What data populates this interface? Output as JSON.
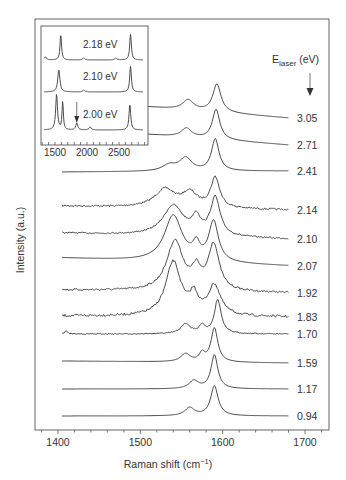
{
  "chart_data": {
    "type": "line",
    "title": "",
    "xlabel": "Raman shift (cm⁻¹)",
    "xlabel_parts": {
      "main": "Raman shift (cm",
      "sup": "−1",
      "end": ")"
    },
    "ylabel": "Intensity (a.u.)",
    "xlim": [
      1370,
      1730
    ],
    "xticks": [
      1400,
      1500,
      1600,
      1700
    ],
    "xtick_labels": [
      "1400",
      "1500",
      "1600",
      "1700"
    ],
    "legend_title": {
      "main": "E",
      "sub": "laser",
      "end": " (eV)"
    },
    "legend_arrow": "down-arrow",
    "grid": false,
    "series": [
      {
        "name": "3.05",
        "baseline_right": 118,
        "baseline_left": 100,
        "peaks": [
          [
            1593,
            28,
            12
          ],
          [
            1558,
            10,
            16
          ]
        ],
        "noise": 0
      },
      {
        "name": "2.71",
        "baseline_right": 145,
        "baseline_left": 128,
        "peaks": [
          [
            1592,
            30,
            11
          ],
          [
            1556,
            9,
            15
          ]
        ],
        "noise": 0
      },
      {
        "name": "2.41",
        "baseline_right": 171,
        "baseline_left": 172,
        "peaks": [
          [
            1591,
            32,
            11
          ],
          [
            1555,
            13,
            18
          ],
          [
            1535,
            6,
            20
          ]
        ],
        "noise": 0
      },
      {
        "name": "2.14",
        "baseline_right": 210,
        "baseline_left": 206,
        "peaks": [
          [
            1591,
            30,
            13
          ],
          [
            1560,
            14,
            22
          ],
          [
            1530,
            18,
            30
          ]
        ],
        "noise": 0.9
      },
      {
        "name": "2.10",
        "baseline_right": 239,
        "baseline_left": 233,
        "peaks": [
          [
            1591,
            38,
            14
          ],
          [
            1540,
            30,
            30
          ],
          [
            1568,
            16,
            12
          ]
        ],
        "noise": 0.7
      },
      {
        "name": "2.07",
        "baseline_right": 266,
        "baseline_left": 258,
        "peaks": [
          [
            1589,
            40,
            14
          ],
          [
            1540,
            46,
            26
          ],
          [
            1568,
            14,
            10
          ]
        ],
        "noise": 0
      },
      {
        "name": "1.92",
        "baseline_right": 293,
        "baseline_left": 290,
        "peaks": [
          [
            1589,
            46,
            16
          ],
          [
            1542,
            50,
            24
          ],
          [
            1568,
            18,
            12
          ]
        ],
        "noise": 1.0
      },
      {
        "name": "1.83",
        "baseline_right": 317,
        "baseline_left": 316,
        "peaks": [
          [
            1590,
            30,
            18
          ],
          [
            1540,
            54,
            22
          ],
          [
            1565,
            18,
            12
          ]
        ],
        "noise": 1.2
      },
      {
        "name": "1.70",
        "baseline_right": 334,
        "baseline_left": 334,
        "peaks": [
          [
            1594,
            34,
            10
          ],
          [
            1555,
            10,
            14
          ],
          [
            1575,
            8,
            8
          ],
          [
            1410,
            3,
            4
          ]
        ],
        "noise": 0.5
      },
      {
        "name": "1.59",
        "baseline_right": 363,
        "baseline_left": 361,
        "peaks": [
          [
            1590,
            34,
            10
          ],
          [
            1555,
            8,
            14
          ],
          [
            1575,
            8,
            8
          ]
        ],
        "noise": 0
      },
      {
        "name": "1.17",
        "baseline_right": 389,
        "baseline_left": 389,
        "peaks": [
          [
            1590,
            34,
            10
          ],
          [
            1565,
            8,
            14
          ]
        ],
        "noise": 0
      },
      {
        "name": "0.94",
        "baseline_right": 416,
        "baseline_left": 416,
        "peaks": [
          [
            1590,
            30,
            11
          ],
          [
            1560,
            8,
            14
          ]
        ],
        "noise": 0
      }
    ],
    "inset": {
      "xlim": [
        1300,
        2900
      ],
      "xticks_labeled": [
        1500,
        2000,
        2500
      ],
      "xtick_labels": [
        "1500",
        "2000",
        "2500"
      ],
      "series": [
        {
          "name": "2.18 eV",
          "baseline": 60,
          "peaks": [
            [
              1590,
              26,
              28
            ],
            [
              2680,
              26,
              30
            ],
            [
              1350,
              3,
              40
            ],
            [
              1950,
              2,
              40
            ],
            [
              2450,
              2,
              40
            ]
          ]
        },
        {
          "name": "2.10 eV",
          "baseline": 92,
          "peaks": [
            [
              1560,
              22,
              40
            ],
            [
              2680,
              26,
              30
            ],
            [
              1950,
              2,
              40
            ]
          ]
        },
        {
          "name": "2.00 eV",
          "baseline": 130,
          "peaks": [
            [
              1525,
              36,
              34
            ],
            [
              1620,
              28,
              24
            ],
            [
              1840,
              7,
              36
            ],
            [
              2050,
              3,
              40
            ],
            [
              2670,
              26,
              32
            ]
          ]
        }
      ],
      "annotation_arrow_x": 1840
    }
  }
}
